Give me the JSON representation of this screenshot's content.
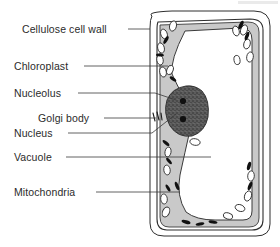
{
  "diagram": {
    "labels": [
      {
        "id": "cellulose-cell-wall",
        "text": "Cellulose cell wall",
        "text_x": 22,
        "text_y": 33,
        "anchor": "start",
        "leader": "M 128 29 L 150 29"
      },
      {
        "id": "chloroplast",
        "text": "Chloroplast",
        "text_x": 14,
        "text_y": 70,
        "anchor": "start",
        "leader": "M 84 66 L 168 66"
      },
      {
        "id": "nucleolus",
        "text": "Nucleolus",
        "text_x": 14,
        "text_y": 97,
        "anchor": "start",
        "leader": "M 78 93 L 155 93 L 176 100"
      },
      {
        "id": "golgi-body",
        "text": "Golgi body",
        "text_x": 38,
        "text_y": 122,
        "anchor": "start",
        "leader": "M 104 118 L 156 118"
      },
      {
        "id": "nucleus",
        "text": "Nucleus",
        "text_x": 14,
        "text_y": 137,
        "anchor": "start",
        "leader": "M 68 133 L 152 133 L 176 114"
      },
      {
        "id": "vacuole",
        "text": "Vacuole",
        "text_x": 14,
        "text_y": 161,
        "anchor": "start",
        "leader": "M 66 157 L 211 157"
      },
      {
        "id": "mitochondria",
        "text": "Mitochondria",
        "text_x": 14,
        "text_y": 196,
        "anchor": "start",
        "leader": "M 96 192 L 180 192"
      }
    ],
    "colors": {
      "cytoplasm": "#c9c9c9",
      "vacuole": "#ffffff",
      "nucleus": "#595959",
      "nucleolus": "#101010",
      "mitochondria": "#111111",
      "chloroplast_fill": "#ffffff",
      "outline": "#2e2e2e",
      "leader_line": "#3a3a3a",
      "text": "#2b2b2b",
      "background": "#ffffff"
    },
    "structures": {
      "cell_wall_outer": "M 152 16 Q 146 12 172 11 L 254 11 Q 270 11 270 26 L 270 224 Q 270 236 256 236 L 164 236 Q 150 236 150 223 L 150 28 Q 150 19 152 16 Z",
      "cell_wall_inner": "M 158 22 L 250 19 Q 263 19 263 30 L 263 220 Q 263 230 252 230 L 167 230 Q 157 230 157 219 L 157 30 Q 157 24 158 22 Z",
      "cytoplasm_region": "M 160 25 L 248 22 Q 259 22 259 32 L 259 218 Q 259 227 249 227 L 169 227 Q 160 227 160 217 Z",
      "vacuole_region": "M 185 31 Q 170 60 172 74 Q 177 85 183 96 Q 194 112 190 130 Q 185 152 180 175 Q 176 196 186 212 Q 196 220 215 220 L 243 220 Q 252 220 252 211 L 252 40 Q 252 28 241 28 Z",
      "nucleus_shape": "M 186 86 Q 172 88 167 100 Q 163 113 170 126 Q 178 138 192 136 Q 205 132 208 117 Q 210 100 202 91 Q 195 85 186 86 Z",
      "nucleolus_dots": [
        {
          "cx": 183,
          "cy": 101,
          "r": 3.1
        },
        {
          "cx": 183,
          "cy": 119,
          "r": 3.1
        }
      ],
      "golgi_strokes": [
        "M 153 113 L 155 121",
        "M 157 112 L 159 120",
        "M 161 113 L 162 120"
      ],
      "chloroplasts": [
        {
          "cx": 164,
          "cy": 34,
          "rx": 3.2,
          "ry": 5.0,
          "rot": -20
        },
        {
          "cx": 173,
          "cy": 26,
          "rx": 3.4,
          "ry": 5.2,
          "rot": 15
        },
        {
          "cx": 161,
          "cy": 48,
          "rx": 3.3,
          "ry": 5.2,
          "rot": -15
        },
        {
          "cx": 160,
          "cy": 60,
          "rx": 3.2,
          "ry": 5.0,
          "rot": -10
        },
        {
          "cx": 163,
          "cy": 72,
          "rx": 3.3,
          "ry": 5.1,
          "rot": -12
        },
        {
          "cx": 170,
          "cy": 70,
          "rx": 3.1,
          "ry": 4.8,
          "rot": 20
        },
        {
          "cx": 195,
          "cy": 142,
          "rx": 5.2,
          "ry": 3.3,
          "rot": 10
        },
        {
          "cx": 168,
          "cy": 152,
          "rx": 3.0,
          "ry": 5.0,
          "rot": 10
        },
        {
          "cx": 167,
          "cy": 170,
          "rx": 3.2,
          "ry": 4.9,
          "rot": -8
        },
        {
          "cx": 164,
          "cy": 199,
          "rx": 3.3,
          "ry": 5.0,
          "rot": -5
        },
        {
          "cx": 166,
          "cy": 212,
          "rx": 3.4,
          "ry": 5.2,
          "rot": 25
        },
        {
          "cx": 244,
          "cy": 30,
          "rx": 3.3,
          "ry": 5.2,
          "rot": 20
        },
        {
          "cx": 236,
          "cy": 31,
          "rx": 3.2,
          "ry": 5.0,
          "rot": -15
        },
        {
          "cx": 247,
          "cy": 44,
          "rx": 3.2,
          "ry": 5.0,
          "rot": 15
        },
        {
          "cx": 250,
          "cy": 57,
          "rx": 3.3,
          "ry": 5.1,
          "rot": 10
        },
        {
          "cx": 251,
          "cy": 176,
          "rx": 3.3,
          "ry": 5.1,
          "rot": 5
        },
        {
          "cx": 248,
          "cy": 196,
          "rx": 3.4,
          "ry": 5.2,
          "rot": 20
        },
        {
          "cx": 240,
          "cy": 208,
          "rx": 5.0,
          "ry": 3.3,
          "rot": 20
        },
        {
          "cx": 228,
          "cy": 216,
          "rx": 4.8,
          "ry": 3.1,
          "rot": 15
        },
        {
          "cx": 237,
          "cy": 60,
          "rx": 3.0,
          "ry": 4.6,
          "rot": -10
        }
      ],
      "mitochondria": [
        {
          "cx": 166,
          "cy": 40,
          "rx": 1.7,
          "ry": 4.3,
          "rot": 30
        },
        {
          "cx": 160,
          "cy": 55,
          "rx": 4.0,
          "ry": 1.5,
          "rot": 5
        },
        {
          "cx": 173,
          "cy": 79,
          "rx": 3.8,
          "ry": 1.6,
          "rot": 35
        },
        {
          "cx": 166,
          "cy": 143,
          "rx": 4.2,
          "ry": 1.6,
          "rot": 40
        },
        {
          "cx": 169,
          "cy": 161,
          "rx": 4.0,
          "ry": 1.5,
          "rot": 50
        },
        {
          "cx": 177,
          "cy": 186,
          "rx": 4.4,
          "ry": 1.7,
          "rot": 70
        },
        {
          "cx": 168,
          "cy": 188,
          "rx": 4.0,
          "ry": 1.5,
          "rot": 60
        },
        {
          "cx": 186,
          "cy": 222,
          "rx": 4.6,
          "ry": 1.7,
          "rot": 15
        },
        {
          "cx": 200,
          "cy": 224,
          "rx": 4.4,
          "ry": 1.6,
          "rot": -10
        },
        {
          "cx": 213,
          "cy": 222,
          "rx": 4.5,
          "ry": 1.6,
          "rot": 10
        },
        {
          "cx": 241,
          "cy": 25,
          "rx": 1.9,
          "ry": 4.6,
          "rot": 25
        },
        {
          "cx": 247,
          "cy": 36,
          "rx": 1.8,
          "ry": 4.4,
          "rot": 20
        },
        {
          "cx": 249,
          "cy": 166,
          "rx": 1.8,
          "ry": 4.4,
          "rot": 15
        },
        {
          "cx": 250,
          "cy": 186,
          "rx": 1.8,
          "ry": 4.4,
          "rot": 20
        }
      ]
    }
  }
}
